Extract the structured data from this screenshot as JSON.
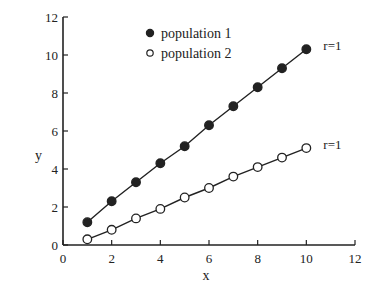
{
  "chart_data": {
    "type": "scatter",
    "title": "",
    "xlabel": "x",
    "ylabel": "y",
    "xlim": [
      0,
      12
    ],
    "ylim": [
      0,
      12
    ],
    "xticks": [
      0,
      2,
      4,
      6,
      8,
      10,
      12
    ],
    "yticks": [
      0,
      2,
      4,
      6,
      8,
      10,
      12
    ],
    "grid": false,
    "legend_position": "upper-left-inside",
    "x": [
      1,
      2,
      3,
      4,
      5,
      6,
      7,
      8,
      9,
      10
    ],
    "series": [
      {
        "name": "population 1",
        "marker": "filled-circle",
        "values": [
          1.2,
          2.3,
          3.3,
          4.3,
          5.2,
          6.3,
          7.3,
          8.3,
          9.3,
          10.3
        ],
        "annotation": "r=1"
      },
      {
        "name": "population 2",
        "marker": "open-circle",
        "values": [
          0.3,
          0.8,
          1.4,
          1.9,
          2.5,
          3.0,
          3.6,
          4.1,
          4.6,
          5.1
        ],
        "annotation": "r=1"
      }
    ]
  },
  "colors": {
    "ink": "#222222",
    "background": "#ffffff"
  }
}
